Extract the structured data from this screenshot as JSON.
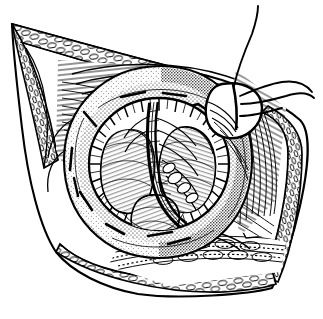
{
  "figure": {
    "domain": "Natural-Image",
    "medium": "pen-and-ink line drawing",
    "title": "",
    "caption": "",
    "background_color": "#ffffff",
    "ink_color": "#000000",
    "labels": [],
    "annotations": []
  },
  "style": {
    "stroke": "#000000",
    "fill_white": "#ffffff",
    "stipple_dot_color": "#000000",
    "hatch_color": "#000000",
    "line_weight_outline": 2.1,
    "line_weight_detail": 0.9,
    "line_weight_hair": 0.5
  },
  "regions": [
    {
      "id": "wound-outline",
      "name": "incision-wound-outline",
      "description": "Large pointed-oval (leaf-shaped) outline of the surgical field, apex upper-left, apex right, lower lobe bottom-centre"
    },
    {
      "id": "skin-margin-upper-left",
      "name": "skin-margin-upper-left",
      "description": "Upper-left retracted skin edge drawn as cobblestone/brick-like subcutaneous fat cells"
    },
    {
      "id": "skin-margin-right",
      "name": "skin-margin-right",
      "description": "Right retracted skin edge with cobblestone fat lobules and a dotted cut border"
    },
    {
      "id": "skin-margin-bottom",
      "name": "skin-margin-bottom",
      "description": "Bottom retracted skin edge with cobblestone fat lobules"
    },
    {
      "id": "muscle-fibres-left",
      "name": "muscle-fibre-bundle-left",
      "description": "Parallel long fibre strokes of muscle/fascia on the left wall of the wound"
    },
    {
      "id": "muscle-fibres-right",
      "name": "muscle-fibre-bundle-right",
      "description": "Parallel long fibre strokes of muscle/fascia on the right wall of the wound"
    },
    {
      "id": "everted-ring",
      "name": "everted-tissue-ring",
      "description": "Thick torus / everted ring of tissue filling the centre, rendered with dense stipple and short dash marks"
    },
    {
      "id": "ring-lumen",
      "name": "ring-lumen",
      "description": "Dark inner rim of the ring opening, heavy short radial hatching"
    },
    {
      "id": "organ-lobe-left",
      "name": "organ-lobe-left",
      "description": "Rounded pale lobe at left inside the lumen with fine curved hatching"
    },
    {
      "id": "organ-lobe-right",
      "name": "organ-lobe-right",
      "description": "Rounded pale lobe at right inside the lumen with fine curved hatching"
    },
    {
      "id": "organ-lobe-lower",
      "name": "organ-lobe-lower",
      "description": "Smaller rounded lobe at the bottom of the lumen"
    },
    {
      "id": "vascular-cord",
      "name": "vascular-cord",
      "description": "Vertical twisted vessel/cord bundle descending through the middle of the lumen and curving to lower right"
    },
    {
      "id": "suture",
      "name": "suture-stitch",
      "description": "Loop of suture passed through the tissue at upper right"
    },
    {
      "id": "suture-threads",
      "name": "suture-thread-tails",
      "description": "Three long free thread tails leaving the suture loop toward the top and right edges of the image"
    },
    {
      "id": "deep-tissue-bottom",
      "name": "deep-tissue-bed",
      "description": "Horizontal bands of deep tissue and vessels visible below the everted ring"
    }
  ]
}
